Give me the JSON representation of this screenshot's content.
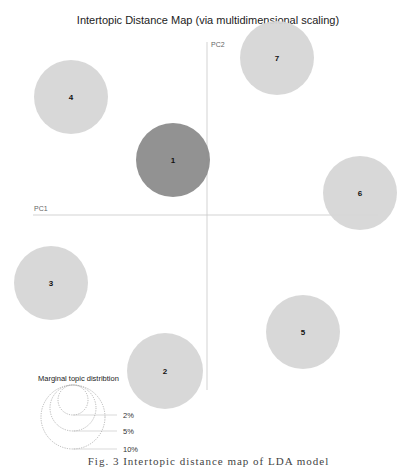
{
  "chart_data": {
    "type": "scatter",
    "title": "Intertopic Distance Map (via multidimensional scaling)",
    "xlabel": "PC1",
    "ylabel": "PC2",
    "grid": false,
    "legend_position": "bottom-left",
    "colors": {
      "selected": "#8c8c8c",
      "default": "#d6d6d6",
      "axis": "#c8c8c8",
      "legend_stroke": "#999999"
    },
    "topics": [
      {
        "id": "1",
        "cx": 173,
        "cy": 160,
        "r": 37,
        "selected": true
      },
      {
        "id": "2",
        "cx": 165,
        "cy": 371,
        "r": 38,
        "selected": false
      },
      {
        "id": "3",
        "cx": 51,
        "cy": 283,
        "r": 37,
        "selected": false
      },
      {
        "id": "4",
        "cx": 71,
        "cy": 97,
        "r": 37,
        "selected": false
      },
      {
        "id": "5",
        "cx": 303,
        "cy": 332,
        "r": 37,
        "selected": false
      },
      {
        "id": "6",
        "cx": 360,
        "cy": 193,
        "r": 37,
        "selected": false
      },
      {
        "id": "7",
        "cx": 277,
        "cy": 58,
        "r": 37,
        "selected": false
      }
    ],
    "axes": {
      "pc1": {
        "x1": 33,
        "x2": 378,
        "y": 215
      },
      "pc2": {
        "x": 207,
        "y1": 42,
        "y2": 390
      }
    },
    "legend": {
      "title": "Marginal topic distribtion",
      "items": [
        {
          "label": "2%",
          "r": 15
        },
        {
          "label": "5%",
          "r": 23
        },
        {
          "label": "10%",
          "r": 32
        }
      ]
    }
  },
  "caption": "Fig. 3  Intertopic distance map of LDA model"
}
